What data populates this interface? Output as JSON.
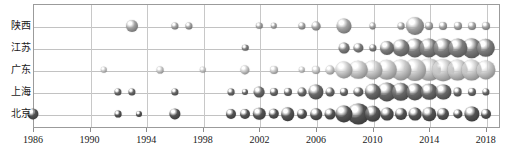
{
  "chart": {
    "type": "bubble",
    "title": "",
    "xlabel": "",
    "ylabel": "",
    "background": "#ffffff",
    "frame_color": "#9b9b9b",
    "grid": true
  },
  "axes": {
    "x": {
      "ticks": [
        "1986",
        "1990",
        "1994",
        "1998",
        "2002",
        "2006",
        "2010",
        "2014",
        "2018"
      ],
      "min": 1986,
      "max": 2019,
      "interval": 4
    },
    "y": {
      "categories": [
        "陕西",
        "江苏",
        "广东",
        "上海",
        "北京"
      ]
    }
  },
  "chart_data": {
    "type": "bubble",
    "title": "",
    "xlabel": "",
    "ylabel": "",
    "x": [
      1986,
      1990,
      1994,
      1998,
      2002,
      2006,
      2010,
      2014,
      2018
    ],
    "categories": [
      "陕西",
      "江苏",
      "广东",
      "上海",
      "北京"
    ],
    "xlim": [
      1986,
      2019
    ],
    "grid": true,
    "legend": "none",
    "series": [
      {
        "name": "陕西",
        "row": 0,
        "color": "#8f8f8f",
        "points": [
          {
            "year": 1993.0,
            "size": 6.0
          },
          {
            "year": 1996.0,
            "size": 3.6
          },
          {
            "year": 1997.0,
            "size": 3.6
          },
          {
            "year": 2002.0,
            "size": 3.2
          },
          {
            "year": 2003.0,
            "size": 3.2
          },
          {
            "year": 2005.0,
            "size": 3.6
          },
          {
            "year": 2006.0,
            "size": 4.4
          },
          {
            "year": 2008.0,
            "size": 7.5
          },
          {
            "year": 2010.0,
            "size": 3.4
          },
          {
            "year": 2012.0,
            "size": 3.4
          },
          {
            "year": 2013.0,
            "size": 9.0
          },
          {
            "year": 2014.0,
            "size": 4.0
          },
          {
            "year": 2015.0,
            "size": 4.0
          },
          {
            "year": 2016.0,
            "size": 4.0
          },
          {
            "year": 2017.0,
            "size": 4.0
          },
          {
            "year": 2018.0,
            "size": 4.0
          }
        ]
      },
      {
        "name": "江苏",
        "row": 1,
        "color": "#6f6f6f",
        "points": [
          {
            "year": 2001.0,
            "size": 3.2
          },
          {
            "year": 2008.0,
            "size": 5.4
          },
          {
            "year": 2009.0,
            "size": 4.6
          },
          {
            "year": 2010.0,
            "size": 3.6
          },
          {
            "year": 2011.0,
            "size": 7.0
          },
          {
            "year": 2012.0,
            "size": 8.6
          },
          {
            "year": 2013.0,
            "size": 9.6
          },
          {
            "year": 2014.0,
            "size": 9.6
          },
          {
            "year": 2015.0,
            "size": 9.6
          },
          {
            "year": 2016.0,
            "size": 9.6
          },
          {
            "year": 2017.0,
            "size": 9.8
          },
          {
            "year": 2018.0,
            "size": 9.2
          }
        ]
      },
      {
        "name": "广东",
        "row": 2,
        "color": "#b0b0b0",
        "points": [
          {
            "year": 1991.0,
            "size": 3.2
          },
          {
            "year": 1995.0,
            "size": 3.4
          },
          {
            "year": 1998.0,
            "size": 3.2
          },
          {
            "year": 2001.0,
            "size": 4.6
          },
          {
            "year": 2003.0,
            "size": 4.0
          },
          {
            "year": 2005.0,
            "size": 3.2
          },
          {
            "year": 2006.0,
            "size": 4.0
          },
          {
            "year": 2007.0,
            "size": 4.4
          },
          {
            "year": 2008.0,
            "size": 8.6
          },
          {
            "year": 2009.0,
            "size": 9.2
          },
          {
            "year": 2010.0,
            "size": 9.6
          },
          {
            "year": 2011.0,
            "size": 10.2
          },
          {
            "year": 2012.0,
            "size": 10.6
          },
          {
            "year": 2013.0,
            "size": 11.0
          },
          {
            "year": 2014.0,
            "size": 11.2
          },
          {
            "year": 2015.0,
            "size": 10.8
          },
          {
            "year": 2016.0,
            "size": 10.4
          },
          {
            "year": 2017.0,
            "size": 10.4
          },
          {
            "year": 2018.0,
            "size": 9.6
          }
        ]
      },
      {
        "name": "上海",
        "row": 3,
        "color": "#5c5c5c",
        "points": [
          {
            "year": 1992.0,
            "size": 3.6
          },
          {
            "year": 1993.0,
            "size": 3.6
          },
          {
            "year": 1996.0,
            "size": 3.6
          },
          {
            "year": 2000.0,
            "size": 3.4
          },
          {
            "year": 2001.0,
            "size": 3.0
          },
          {
            "year": 2002.0,
            "size": 5.4
          },
          {
            "year": 2003.0,
            "size": 4.0
          },
          {
            "year": 2004.0,
            "size": 4.0
          },
          {
            "year": 2005.0,
            "size": 4.4
          },
          {
            "year": 2006.0,
            "size": 7.6
          },
          {
            "year": 2007.0,
            "size": 4.4
          },
          {
            "year": 2008.0,
            "size": 4.0
          },
          {
            "year": 2009.0,
            "size": 4.6
          },
          {
            "year": 2010.0,
            "size": 8.2
          },
          {
            "year": 2011.0,
            "size": 9.6
          },
          {
            "year": 2012.0,
            "size": 9.2
          },
          {
            "year": 2013.0,
            "size": 8.6
          },
          {
            "year": 2014.0,
            "size": 8.2
          },
          {
            "year": 2015.0,
            "size": 7.6
          },
          {
            "year": 2016.0,
            "size": 4.4
          },
          {
            "year": 2017.0,
            "size": 4.0
          },
          {
            "year": 2018.0,
            "size": 3.6
          }
        ]
      },
      {
        "name": "北京",
        "row": 4,
        "color": "#4a4a4a",
        "points": [
          {
            "year": 1986.0,
            "size": 5.6
          },
          {
            "year": 1992.0,
            "size": 3.4
          },
          {
            "year": 1993.5,
            "size": 3.0
          },
          {
            "year": 1996.0,
            "size": 5.6
          },
          {
            "year": 2000.0,
            "size": 5.0
          },
          {
            "year": 2001.0,
            "size": 5.0
          },
          {
            "year": 2002.0,
            "size": 6.2
          },
          {
            "year": 2003.0,
            "size": 5.2
          },
          {
            "year": 2004.0,
            "size": 6.8
          },
          {
            "year": 2005.0,
            "size": 5.0
          },
          {
            "year": 2006.0,
            "size": 5.8
          },
          {
            "year": 2007.0,
            "size": 5.4
          },
          {
            "year": 2008.0,
            "size": 8.6
          },
          {
            "year": 2009.0,
            "size": 10.6
          },
          {
            "year": 2010.0,
            "size": 8.2
          },
          {
            "year": 2011.0,
            "size": 6.4
          },
          {
            "year": 2012.0,
            "size": 6.0
          },
          {
            "year": 2013.0,
            "size": 6.4
          },
          {
            "year": 2014.0,
            "size": 6.8
          },
          {
            "year": 2015.0,
            "size": 6.0
          },
          {
            "year": 2016.0,
            "size": 4.6
          },
          {
            "year": 2017.0,
            "size": 7.6
          },
          {
            "year": 2018.0,
            "size": 5.0
          }
        ]
      }
    ]
  }
}
